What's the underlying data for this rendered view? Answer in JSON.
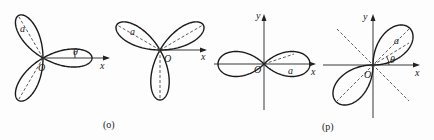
{
  "figure": {
    "panels": [
      {
        "id": "o",
        "caption": "(o)",
        "subfigures": [
          {
            "curve": "three-leaf rose",
            "petal_angles_deg": [
              0,
              120,
              240
            ],
            "labels": {
              "origin": "O",
              "x_axis": "x",
              "radius": "a",
              "angle": "θ"
            }
          },
          {
            "curve": "three-leaf rose",
            "petal_angles_deg": [
              30,
              150,
              270
            ],
            "labels": {
              "origin": "O",
              "x_axis": "x",
              "radius": "a"
            }
          }
        ]
      },
      {
        "id": "p",
        "caption": "(p)",
        "subfigures": [
          {
            "curve": "four-leaf rose",
            "petal_angles_deg": [
              0,
              90,
              180,
              270
            ],
            "labels": {
              "origin": "O",
              "x_axis": "x",
              "y_axis": "y",
              "radius": "a"
            }
          },
          {
            "curve": "four-leaf rose",
            "petal_angles_deg": [
              45,
              135,
              225,
              315
            ],
            "labels": {
              "origin": "O",
              "x_axis": "x",
              "y_axis": "y",
              "radius": "a",
              "angle": "θ"
            }
          }
        ]
      }
    ]
  }
}
